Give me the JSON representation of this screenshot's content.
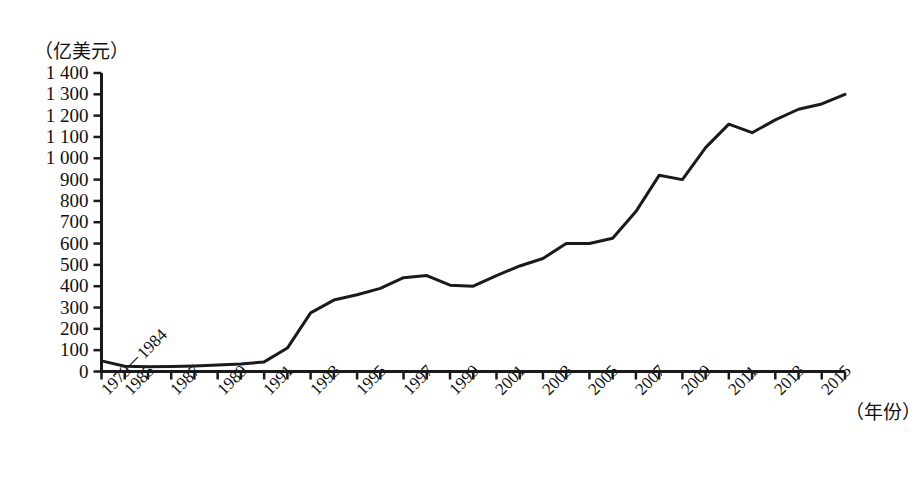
{
  "chart_data": {
    "type": "line",
    "title": "",
    "subtitle": "",
    "ylabel": "（亿美元）",
    "xlabel": "（年份）",
    "ylim": [
      0,
      1400
    ],
    "ytick_step": 100,
    "yticks": [
      "0",
      "100",
      "200",
      "300",
      "400",
      "500",
      "600",
      "700",
      "800",
      "900",
      "1 000",
      "1 100",
      "1 200",
      "1 300",
      "1 400"
    ],
    "grid": false,
    "legend": "none",
    "line_color": "#1a1a1a",
    "line_width": 3,
    "axis_color": "#1a1a1a",
    "categories": [
      "1979－1984",
      "1985",
      "1986",
      "1987",
      "1988",
      "1989",
      "1990",
      "1991",
      "1992",
      "1993",
      "1994",
      "1995",
      "1996",
      "1997",
      "1998",
      "1999",
      "2000",
      "2001",
      "2002",
      "2003",
      "2004",
      "2005",
      "2006",
      "2007",
      "2008",
      "2009",
      "2010",
      "2011",
      "2012",
      "2013",
      "2014",
      "2015",
      "2016"
    ],
    "xtick_labels_shown": [
      "1979－1984",
      "1986",
      "1988",
      "1990",
      "1992",
      "1994",
      "1996",
      "1998",
      "2000",
      "2002",
      "2004",
      "2006",
      "2008",
      "2010",
      "2012",
      "2014",
      "2016"
    ],
    "values": [
      50,
      25,
      22,
      24,
      26,
      30,
      35,
      45,
      110,
      275,
      335,
      360,
      390,
      440,
      450,
      405,
      400,
      450,
      495,
      530,
      600,
      600,
      625,
      750,
      920,
      900,
      1050,
      1160,
      1120,
      1180,
      1230,
      1255,
      1300
    ],
    "series": [
      {
        "name": "实际利用外商直接投资",
        "values": [
          50,
          25,
          22,
          24,
          26,
          30,
          35,
          45,
          110,
          275,
          335,
          360,
          390,
          440,
          450,
          405,
          400,
          450,
          495,
          530,
          600,
          600,
          625,
          750,
          920,
          900,
          1050,
          1160,
          1120,
          1180,
          1230,
          1255,
          1300
        ]
      }
    ],
    "annotations": []
  },
  "axes": {
    "y_axis_name": "y-axis",
    "x_axis_name": "x-axis"
  }
}
